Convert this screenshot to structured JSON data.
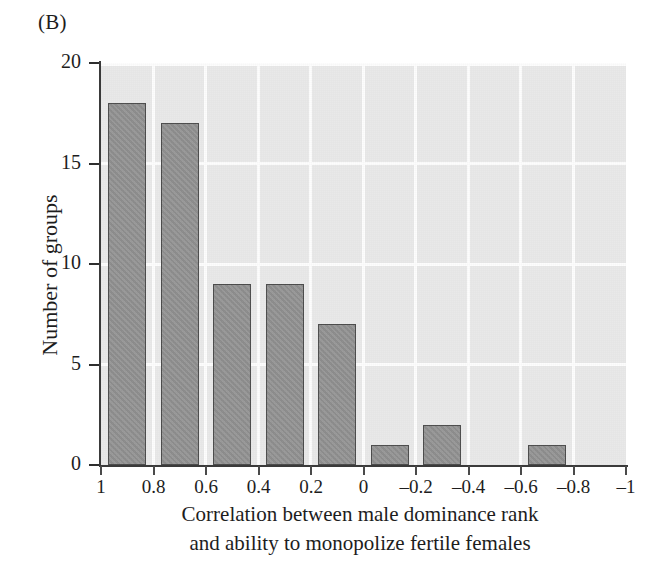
{
  "panel": {
    "label": "(B)"
  },
  "colors": {
    "plot_background": "#e9e9e9",
    "bar_fill": "#949494",
    "bar_edge": "#4c4c4c",
    "gridline": "#fdfdfd",
    "axis": "#3a3a3a",
    "text": "#1d1d1d",
    "page_background": "#ffffff"
  },
  "chart_data": {
    "type": "bar",
    "title": "",
    "subtitle": "",
    "xlabel": "Correlation between male dominance rank and ability to monopolize fertile females",
    "xlabel_lines": [
      "Correlation between male dominance rank",
      "and ability to monopolize fertile females"
    ],
    "ylabel": "Number of groups",
    "categories": [
      "1 to 0.8",
      "0.8 to 0.6",
      "0.6 to 0.4",
      "0.4 to 0.2",
      "0.2 to 0",
      "0 to -0.2",
      "-0.2 to -0.4",
      "-0.4 to -0.6",
      "-0.6 to -0.8",
      "-0.8 to -1"
    ],
    "values": [
      18,
      17,
      9,
      9,
      7,
      1,
      2,
      0,
      1,
      0
    ],
    "bin_edges": [
      1,
      0.8,
      0.6,
      0.4,
      0.2,
      0,
      -0.2,
      -0.4,
      -0.6,
      -0.8,
      -1
    ],
    "xtick_labels": [
      "1",
      "0.8",
      "0.6",
      "0.4",
      "0.2",
      "0",
      "–0.2",
      "–0.4",
      "–0.6",
      "–0.8",
      "–1"
    ],
    "ytick_labels": [
      "0",
      "5",
      "10",
      "15",
      "20"
    ],
    "ytick_values": [
      0,
      5,
      10,
      15,
      20
    ],
    "ylim": [
      0,
      20
    ],
    "xlim": [
      1,
      -1
    ],
    "x_axis_direction": "descending",
    "grid": true,
    "grid_axis": "both",
    "legend": "none"
  }
}
